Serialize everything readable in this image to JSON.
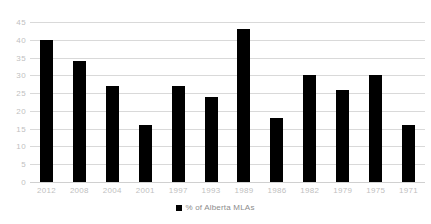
{
  "chart_data": {
    "type": "bar",
    "title": "",
    "subtitle": "",
    "xlabel": "",
    "ylabel": "",
    "categories": [
      "2012",
      "2008",
      "2004",
      "2001",
      "1997",
      "1993",
      "1989",
      "1986",
      "1982",
      "1979",
      "1975",
      "1971"
    ],
    "values": [
      40,
      34,
      27,
      16,
      27,
      24,
      43,
      18,
      30,
      26,
      30,
      16
    ],
    "series": [
      {
        "name": "% of Alberta MLAs",
        "color": "#000000",
        "values": [
          40,
          34,
          27,
          16,
          27,
          24,
          43,
          18,
          30,
          26,
          30,
          16
        ]
      }
    ],
    "ylim": [
      0,
      45
    ],
    "yticks": [
      0,
      5,
      10,
      15,
      20,
      25,
      30,
      35,
      40,
      45
    ],
    "ytick_labels": [
      "0",
      "5",
      "10",
      "15",
      "20",
      "25",
      "30",
      "35",
      "40",
      "45"
    ],
    "grid": true,
    "grid_color": "#d9d9d9",
    "legend": {
      "position": "bottom",
      "entries": [
        {
          "label": "% of Alberta MLAs",
          "marker": "square-marker",
          "color": "#000000"
        }
      ]
    },
    "axis_label_color": "#bfbfbf",
    "background": "#ffffff"
  }
}
